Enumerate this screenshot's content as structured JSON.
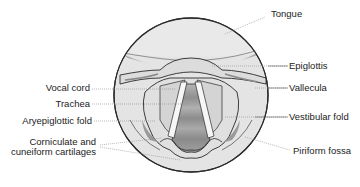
{
  "diagram": {
    "labels_left": [
      {
        "id": "vocal-cord",
        "text": "Vocal cord"
      },
      {
        "id": "trachea",
        "text": "Trachea"
      },
      {
        "id": "aryepiglottic-fold",
        "text": "Aryepiglottic fold"
      },
      {
        "id": "corniculate-cuneiform",
        "text": "Corniculate and\ncuneiform cartilages"
      }
    ],
    "labels_right": [
      {
        "id": "tongue",
        "text": "Tongue"
      },
      {
        "id": "epiglottis",
        "text": "Epiglottis"
      },
      {
        "id": "vallecula",
        "text": "Vallecula"
      },
      {
        "id": "vestibular-fold",
        "text": "Vestibular fold"
      },
      {
        "id": "piriform-fossa",
        "text": "Piriform fossa"
      }
    ],
    "colors": {
      "outline": "#2a2a2a",
      "light_fill": "#e6e6e6",
      "mid_fill": "#cfcfcf",
      "dark_fill": "#9a9a9a",
      "leader_line": "#8a8a8a"
    }
  }
}
